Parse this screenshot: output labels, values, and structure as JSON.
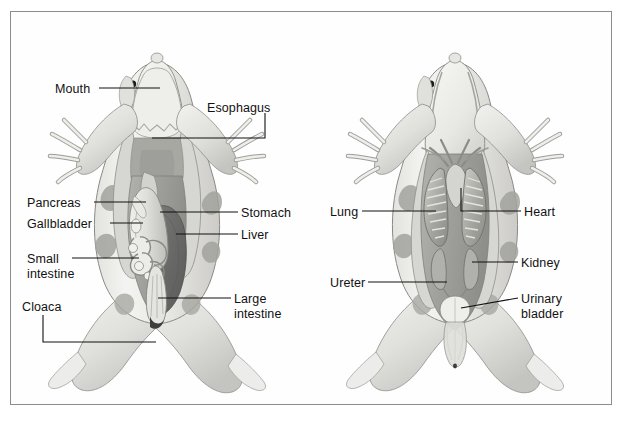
{
  "figure": {
    "border_color": "#8c8c8c",
    "background_color": "#ffffff",
    "ink_color": "#111111"
  },
  "panels": [
    {
      "id": "left-panel",
      "name": "digestive-system-view",
      "labels": [
        {
          "name": "mouth",
          "text": "Mouth",
          "x": 55,
          "y": 82,
          "align": "left"
        },
        {
          "name": "esophagus",
          "text": "Esophagus",
          "x": 207,
          "y": 101,
          "align": "left"
        },
        {
          "name": "pancreas",
          "text": "Pancreas",
          "x": 27,
          "y": 196,
          "align": "left"
        },
        {
          "name": "gallbladder",
          "text": "Gallbladder",
          "x": 27,
          "y": 217,
          "align": "left"
        },
        {
          "name": "stomach",
          "text": "Stomach",
          "x": 241,
          "y": 206,
          "align": "left"
        },
        {
          "name": "liver",
          "text": "Liver",
          "x": 241,
          "y": 228,
          "align": "left"
        },
        {
          "name": "small-intestine",
          "text": "Small\nintestine",
          "x": 27,
          "y": 252,
          "align": "left"
        },
        {
          "name": "large-intestine",
          "text": "Large\nintestine",
          "x": 234,
          "y": 292,
          "align": "left"
        },
        {
          "name": "cloaca",
          "text": "Cloaca",
          "x": 22,
          "y": 300,
          "align": "left"
        }
      ]
    },
    {
      "id": "right-panel",
      "name": "respiratory-urogenital-view",
      "labels": [
        {
          "name": "lung",
          "text": "Lung",
          "x": 330,
          "y": 205,
          "align": "left"
        },
        {
          "name": "heart",
          "text": "Heart",
          "x": 524,
          "y": 205,
          "align": "left"
        },
        {
          "name": "kidney",
          "text": "Kidney",
          "x": 521,
          "y": 256,
          "align": "left"
        },
        {
          "name": "ureter",
          "text": "Ureter",
          "x": 330,
          "y": 276,
          "align": "left"
        },
        {
          "name": "urinary-bladder",
          "text": "Urinary\nbladder",
          "x": 521,
          "y": 292,
          "align": "left"
        }
      ]
    }
  ],
  "palette": {
    "skin_light": "#efefed",
    "skin_mid": "#d8d8d4",
    "skin_shadow": "#b9b9b4",
    "cavity_gray": "#a8a8a4",
    "organ_mid": "#9a9a96",
    "liver_dark": "#6c6c6a",
    "organ_pale": "#e4e4e0",
    "outline": "#555555",
    "leader": "#111111"
  }
}
